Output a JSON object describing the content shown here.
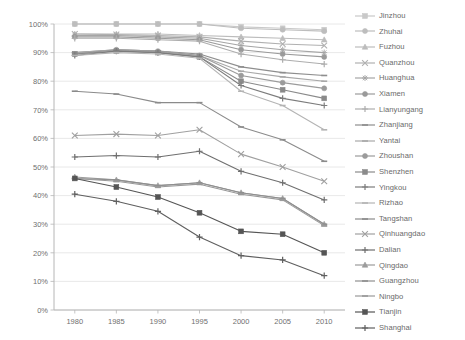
{
  "chart_data": {
    "type": "line",
    "title": "",
    "xlabel": "",
    "ylabel": "",
    "x": [
      1980,
      1985,
      1990,
      1995,
      2000,
      2005,
      2010
    ],
    "xtick_labels": [
      "1980",
      "1985",
      "1990",
      "1995",
      "2000",
      "2005",
      "2010"
    ],
    "ytick_labels": [
      "0%",
      "10%",
      "20%",
      "30%",
      "40%",
      "50%",
      "60%",
      "70%",
      "80%",
      "90%",
      "100%"
    ],
    "ytick_values": [
      0,
      10,
      20,
      30,
      40,
      50,
      60,
      70,
      80,
      90,
      100
    ],
    "ylim": [
      0,
      100
    ],
    "xlim": [
      1977.5,
      2012.5
    ],
    "grid": true,
    "grid_axis": "y",
    "legend_position": "right",
    "value_unit": "percent",
    "series": [
      {
        "name": "Jinzhou",
        "color": "#c9c9c9",
        "marker": "square",
        "values": [
          100.0,
          100.0,
          100.0,
          100.0,
          99.0,
          98.5,
          98.0
        ]
      },
      {
        "name": "Zhuhai",
        "color": "#bdbdbd",
        "marker": "circle",
        "values": [
          100.0,
          100.0,
          100.0,
          100.0,
          98.5,
          98.0,
          97.5
        ]
      },
      {
        "name": "Fuzhou",
        "color": "#bcbcbc",
        "marker": "triangle",
        "values": [
          96.5,
          96.5,
          96.5,
          96.0,
          95.5,
          95.0,
          94.5
        ]
      },
      {
        "name": "Quanzhou",
        "color": "#b0b0b0",
        "marker": "cross",
        "values": [
          96.5,
          96.3,
          96.0,
          95.5,
          94.0,
          93.0,
          92.5
        ]
      },
      {
        "name": "Huanghua",
        "color": "#a5a5a5",
        "marker": "star",
        "values": [
          96.0,
          96.0,
          95.5,
          95.0,
          92.5,
          91.0,
          90.0
        ]
      },
      {
        "name": "Xiamen",
        "color": "#9a9a9a",
        "marker": "circle",
        "values": [
          95.5,
          95.5,
          95.0,
          94.5,
          91.0,
          89.5,
          88.5
        ]
      },
      {
        "name": "Lianyungang",
        "color": "#adadad",
        "marker": "plus",
        "values": [
          95.0,
          95.0,
          94.5,
          94.0,
          89.5,
          87.5,
          86.0
        ]
      },
      {
        "name": "Zhanjiang",
        "color": "#8e8e8e",
        "marker": "dash",
        "values": [
          90.0,
          91.0,
          90.5,
          89.5,
          85.0,
          83.0,
          82.0
        ]
      },
      {
        "name": "Yantai",
        "color": "#a8a8a8",
        "marker": "dash",
        "values": [
          90.0,
          91.0,
          90.5,
          89.0,
          83.5,
          81.5,
          80.0
        ]
      },
      {
        "name": "Zhoushan",
        "color": "#9b9b9b",
        "marker": "circle",
        "values": [
          89.5,
          91.0,
          90.5,
          89.0,
          82.0,
          79.5,
          77.5
        ]
      },
      {
        "name": "Shenzhen",
        "color": "#8a8a8a",
        "marker": "square",
        "values": [
          89.5,
          90.5,
          90.0,
          88.5,
          80.0,
          77.0,
          74.0
        ]
      },
      {
        "name": "Yingkou",
        "color": "#7c7c7c",
        "marker": "plus",
        "values": [
          89.0,
          90.5,
          90.0,
          88.5,
          78.5,
          74.0,
          71.5
        ]
      },
      {
        "name": "Rizhao",
        "color": "#b4b4b4",
        "marker": "dash",
        "values": [
          89.0,
          90.0,
          89.5,
          88.0,
          76.5,
          71.5,
          63.0
        ]
      },
      {
        "name": "Tangshan",
        "color": "#8b8b8b",
        "marker": "dash",
        "values": [
          76.5,
          75.5,
          72.5,
          72.5,
          64.0,
          59.5,
          52.0
        ]
      },
      {
        "name": "Qinhuangdao",
        "color": "#a0a0a0",
        "marker": "cross",
        "values": [
          61.0,
          61.5,
          61.0,
          63.0,
          54.5,
          50.0,
          45.0
        ]
      },
      {
        "name": "Dalian",
        "color": "#6f6f6f",
        "marker": "plus",
        "values": [
          53.5,
          54.0,
          53.5,
          55.5,
          48.5,
          44.5,
          38.5
        ]
      },
      {
        "name": "Qingdao",
        "color": "#9c9c9c",
        "marker": "triangle",
        "values": [
          46.5,
          45.5,
          43.5,
          44.5,
          41.0,
          39.0,
          30.0
        ]
      },
      {
        "name": "Guangzhou",
        "color": "#8f8f8f",
        "marker": "dash",
        "values": [
          46.0,
          45.5,
          43.5,
          44.5,
          41.0,
          39.0,
          30.0
        ]
      },
      {
        "name": "Ningbo",
        "color": "#999999",
        "marker": "dash",
        "values": [
          46.0,
          45.0,
          43.0,
          44.0,
          40.5,
          38.5,
          29.5
        ]
      },
      {
        "name": "Tianjin",
        "color": "#555555",
        "marker": "square",
        "values": [
          46.0,
          43.0,
          39.5,
          34.0,
          27.5,
          26.5,
          20.0
        ]
      },
      {
        "name": "Shanghai",
        "color": "#5f5f5f",
        "marker": "plus",
        "values": [
          40.5,
          38.0,
          34.5,
          25.5,
          19.0,
          17.5,
          12.0
        ]
      }
    ],
    "legend_entries": [
      "Jinzhou",
      "Zhuhai",
      "Fuzhou",
      "Quanzhou",
      "Huanghua",
      "Xiamen",
      "Lianyungang",
      "Zhanjiang",
      "Yantai",
      "Zhoushan",
      "Shenzhen",
      "Yingkou",
      "Rizhao",
      "Tangshan",
      "Qinhuangdao",
      "Dalian",
      "Qingdao",
      "Guangzhou",
      "Ningbo",
      "Tianjin",
      "Shanghai"
    ]
  },
  "axis": {
    "y_labels": [
      "100%",
      "90%",
      "80%",
      "70%",
      "60%",
      "50%",
      "40%",
      "30%",
      "20%",
      "10%",
      "0%"
    ],
    "x_labels": [
      "1980",
      "1985",
      "1990",
      "1995",
      "2000",
      "2005",
      "2010"
    ]
  }
}
